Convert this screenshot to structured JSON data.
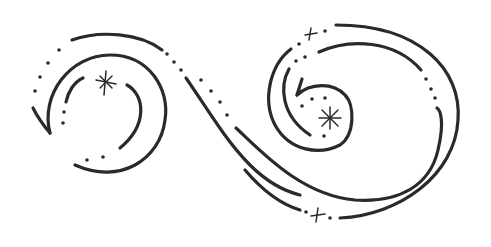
{
  "illustration": {
    "title": "",
    "description": "Hand-drawn decorative double swirl with dotted trails and sparkle stars",
    "colors": {
      "background": "#ffffff",
      "ink": "#2a2a2a"
    },
    "stroke_width": 3.2,
    "elements": {
      "left_spiral": {
        "star": {
          "x": 106,
          "y": 82,
          "size": 9
        },
        "dots": [
          [
            59,
            50
          ],
          [
            48,
            63
          ],
          [
            40,
            77
          ],
          [
            35,
            91
          ],
          [
            64,
            112
          ],
          [
            63,
            123
          ],
          [
            87,
            160
          ],
          [
            103,
            157
          ],
          [
            167,
            53
          ],
          [
            174,
            62
          ],
          [
            180,
            71
          ]
        ]
      },
      "middle_dots": [
        [
          201,
          80
        ],
        [
          211,
          91
        ],
        [
          220,
          102
        ],
        [
          227,
          115
        ]
      ],
      "right_spiral": {
        "stars": [
          {
            "x": 311,
            "y": 34,
            "size": 5
          },
          {
            "x": 330,
            "y": 118,
            "size": 9
          },
          {
            "x": 318,
            "y": 215,
            "size": 5
          }
        ],
        "dots": [
          [
            325,
            31
          ],
          [
            299,
            44
          ],
          [
            296,
            61
          ],
          [
            305,
            57
          ],
          [
            312,
            99
          ],
          [
            327,
            98
          ],
          [
            325,
            97
          ],
          [
            302,
            107
          ],
          [
            324,
            136
          ],
          [
            426,
            79
          ],
          [
            431,
            88
          ],
          [
            435,
            98
          ],
          [
            306,
            212
          ],
          [
            330,
            218
          ]
        ]
      }
    }
  }
}
